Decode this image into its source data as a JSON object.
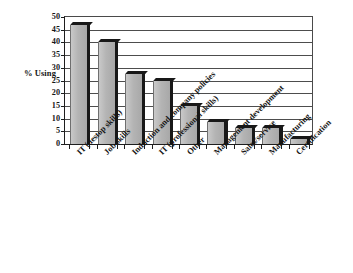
{
  "chart_data": {
    "type": "bar",
    "title": "",
    "xlabel": "",
    "ylabel": "% Using",
    "ylim": [
      0,
      50
    ],
    "yticks": [
      0,
      5,
      10,
      15,
      20,
      25,
      30,
      35,
      40,
      45,
      50
    ],
    "grid": true,
    "legend": "none",
    "orientation": "vertical",
    "bar_style": "3d-shaded-gray",
    "categories": [
      "IT (destop skills)",
      "Job skills",
      "Induction and company policies",
      "IT (professional skills)",
      "Other",
      "Management development",
      "Sales/service",
      "Manufacturing",
      "Certification"
    ],
    "values": [
      47,
      40,
      27.5,
      25,
      15,
      8.5,
      6.5,
      6.5,
      2
    ],
    "series": [
      {
        "name": "% Using",
        "values": [
          47,
          40,
          27.5,
          25,
          15,
          8.5,
          6.5,
          6.5,
          2
        ]
      }
    ]
  },
  "axis": {
    "y_label": "% Using",
    "y_tick_labels": [
      "50",
      "45",
      "40",
      "35",
      "30",
      "25",
      "20",
      "15",
      "10",
      "5",
      "0"
    ]
  },
  "colors": {
    "bar_fill": "#b9b9b9",
    "bar_shadow": "#181818",
    "grid": "#4d4d4d",
    "axis": "#1e1e1e",
    "background": "#ffffff",
    "text": "#161616"
  }
}
